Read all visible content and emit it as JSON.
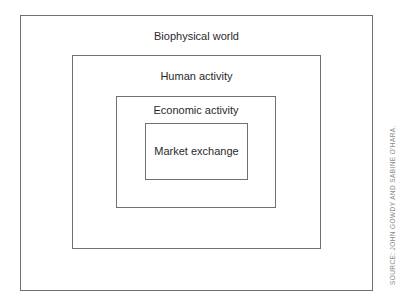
{
  "diagram": {
    "type": "nested-boxes",
    "layers": [
      {
        "label": "Biophysical world"
      },
      {
        "label": "Human activity"
      },
      {
        "label": "Economic activity"
      },
      {
        "label": "Market exchange"
      }
    ],
    "source": "SOURCE: JOHN GOWDY AND SABINE O'HARA."
  }
}
